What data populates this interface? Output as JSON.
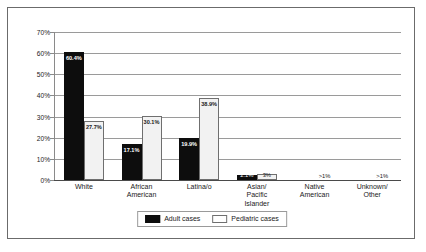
{
  "chart_data": {
    "type": "bar",
    "title": "",
    "subtitle": "",
    "xlabel": "",
    "ylabel": "",
    "ylim": [
      0,
      70
    ],
    "grid": true,
    "legend_position": "bottom",
    "y_ticks": [
      "0%",
      "10%",
      "20%",
      "30%",
      "40%",
      "50%",
      "60%",
      "70%"
    ],
    "y_tick_values": [
      0,
      10,
      20,
      30,
      40,
      50,
      60,
      70
    ],
    "categories": [
      "White",
      "African\nAmerican",
      "Latina/o",
      "Asian/\nPacific\nIslander",
      "Native\nAmerican",
      "Unknown/\nOther"
    ],
    "series": [
      {
        "name": "Adult cases",
        "color": "#0d0d0d",
        "values": [
          60.4,
          17.1,
          19.9,
          2.1,
          0.5,
          0.5
        ],
        "labels": [
          "60.4%",
          "17.1%",
          "19.9%",
          "2.1%",
          ">1%",
          ">1%"
        ]
      },
      {
        "name": "Pediatric cases",
        "color": "#ffffff",
        "values": [
          27.7,
          30.1,
          38.9,
          3.0,
          0.5,
          0.5
        ],
        "labels": [
          "27.7%",
          "30.1%",
          "38.9%",
          "3%",
          ">1%",
          ">1%"
        ]
      }
    ]
  },
  "legend": {
    "items": [
      {
        "label": "Adult cases",
        "swatch": "black-square-icon"
      },
      {
        "label": "Pediatric cases",
        "swatch": "white-square-icon"
      }
    ]
  }
}
